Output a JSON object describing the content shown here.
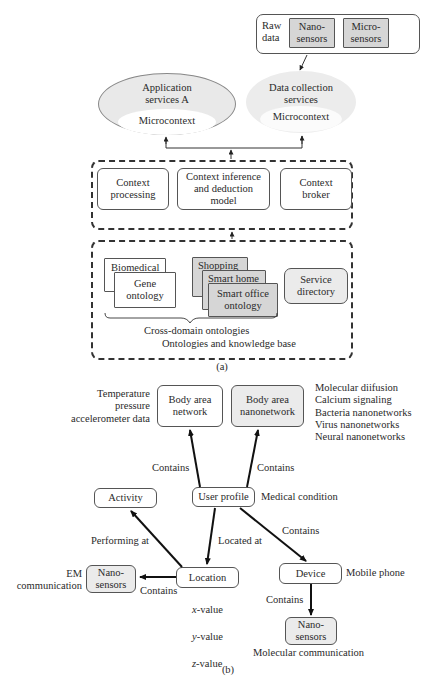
{
  "diagram_a": {
    "caption": "(a)",
    "raw_data": {
      "label": "Raw\ndata",
      "nano_sensors": "Nano-\nsensors",
      "micro_sensors": "Micro-\nsensors"
    },
    "application_services": {
      "title": "Application\nservices A",
      "inner": "Microcontext"
    },
    "data_collection_services": {
      "title": "Data collection\nservices",
      "inner": "Microcontext"
    },
    "context_layer": {
      "context_processing": "Context\nprocessing",
      "context_inference": "Context inference\nand deduction\nmodel",
      "context_broker": "Context\nbroker"
    },
    "ontology_layer": {
      "biomedical": "Biomedical",
      "gene_ontology": "Gene\nontology",
      "shopping": "Shopping",
      "smart_home": "Smart home",
      "smart_office": "Smart office\nontology",
      "service_directory": "Service\ndirectory",
      "cross_domain_label": "Cross-domain ontologies",
      "layer_label": "Ontologies and knowledge base"
    }
  },
  "diagram_b": {
    "caption": "(b)",
    "nodes": {
      "body_area_network": "Body area\nnetwork",
      "body_area_nanonetwork": "Body area\nnanonetwork",
      "user_profile": "User profile",
      "activity": "Activity",
      "location": "Location",
      "device": "Device",
      "nano_sensors_left": "Nano-\nsensors",
      "nano_sensors_bottom": "Nano-\nsensors"
    },
    "annotations": {
      "ban_data": "Temperature\npressure\naccelerometer data",
      "nanonetwork_types": "Molecular diifusion\nCalcium signaling\nBacteria nanonetworks\nVirus nanonetworks\nNeural nanonetworks",
      "medical_condition": "Medical condition",
      "mobile_phone": "Mobile phone",
      "em_communication": "EM\ncommunication",
      "xyz_values": [
        "x",
        "-value",
        "y",
        "-value",
        "z",
        "-value"
      ],
      "molecular_communication": "Molecular communication"
    },
    "edge_labels": {
      "contains_ban": "Contains",
      "contains_nano": "Contains",
      "performing_at": "Performing at",
      "located_at": "Located at",
      "contains_device": "Contains",
      "contains_nano_left": "Contains",
      "contains_nano_bottom": "Contains"
    }
  }
}
